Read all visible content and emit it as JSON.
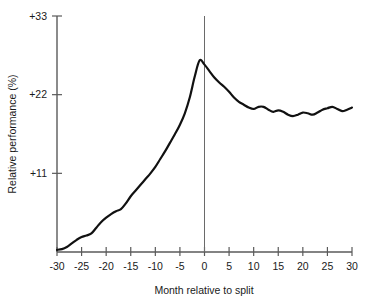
{
  "chart_data": {
    "type": "line",
    "title": "",
    "xlabel": "Month relative to split",
    "ylabel": "Relative performance (%)",
    "xlim": [
      -30,
      30
    ],
    "ylim": [
      0,
      33
    ],
    "grid": false,
    "legend": "none",
    "x_ticks": [
      -30,
      -25,
      -20,
      -15,
      -10,
      -5,
      0,
      5,
      10,
      15,
      20,
      25,
      30
    ],
    "x_tick_labels": [
      "-30",
      "-25",
      "-20",
      "-15",
      "-10",
      "-5",
      "0",
      "5",
      "10",
      "15",
      "20",
      "25",
      "30"
    ],
    "y_ticks": [
      11,
      22,
      33
    ],
    "y_tick_labels": [
      "+11",
      "+22",
      "+33"
    ],
    "annotations": [
      {
        "name": "split-reference-line",
        "type": "vline",
        "x": 0
      }
    ],
    "series": [
      {
        "name": "Relative performance",
        "color": "#111111",
        "x": [
          -30,
          -29,
          -28,
          -27,
          -26,
          -25,
          -24,
          -23,
          -22,
          -21,
          -20,
          -19,
          -18,
          -17,
          -16,
          -15,
          -14,
          -13,
          -12,
          -11,
          -10,
          -9,
          -8,
          -7,
          -6,
          -5,
          -4,
          -3,
          -2,
          -1,
          0,
          1,
          2,
          3,
          4,
          5,
          6,
          7,
          8,
          9,
          10,
          11,
          12,
          13,
          14,
          15,
          16,
          17,
          18,
          19,
          20,
          21,
          22,
          23,
          24,
          25,
          26,
          27,
          28,
          29,
          30
        ],
        "values": [
          0.3,
          0.4,
          0.7,
          1.2,
          1.7,
          2.1,
          2.3,
          2.6,
          3.4,
          4.2,
          4.8,
          5.3,
          5.7,
          6.0,
          6.8,
          7.8,
          8.6,
          9.4,
          10.2,
          11.0,
          11.9,
          13.0,
          14.1,
          15.3,
          16.5,
          17.8,
          19.4,
          21.6,
          24.5,
          26.8,
          26.2,
          25.3,
          24.4,
          23.7,
          23.1,
          22.4,
          21.6,
          21.0,
          20.6,
          20.2,
          20.0,
          20.3,
          20.3,
          19.9,
          19.6,
          19.8,
          19.6,
          19.2,
          19.0,
          19.2,
          19.5,
          19.4,
          19.2,
          19.5,
          19.9,
          20.1,
          20.3,
          20.0,
          19.7,
          19.9,
          20.2
        ]
      }
    ]
  },
  "axes": {
    "y_title": "Relative performance (%)",
    "x_title": "Month relative to split"
  }
}
